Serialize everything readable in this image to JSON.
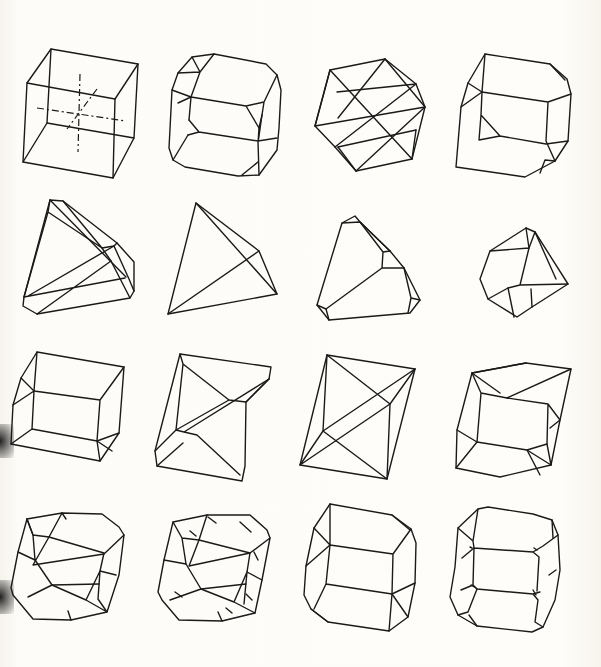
{
  "page": {
    "background": "#fdfcf8",
    "line_color": "#1a1a1a",
    "layout": "4x4 grid of crystal forms"
  },
  "figures": [
    {
      "row": 1,
      "col": 1,
      "name": "cube with crystallographic axes"
    },
    {
      "row": 1,
      "col": 2,
      "name": "cube modified by octahedron corners"
    },
    {
      "row": 1,
      "col": 3,
      "name": "cuboctahedron"
    },
    {
      "row": 1,
      "col": 4,
      "name": "cube with truncated corners"
    },
    {
      "row": 2,
      "col": 1,
      "name": "tetrahedron modified by cube"
    },
    {
      "row": 2,
      "col": 2,
      "name": "tetrahedron"
    },
    {
      "row": 2,
      "col": 3,
      "name": "tetrahedron with truncated corners"
    },
    {
      "row": 2,
      "col": 4,
      "name": "octahedron combination"
    },
    {
      "row": 3,
      "col": 1,
      "name": "cube with bevelled edges"
    },
    {
      "row": 3,
      "col": 2,
      "name": "rhombohedron with modified edges"
    },
    {
      "row": 3,
      "col": 3,
      "name": "rhombohedron"
    },
    {
      "row": 3,
      "col": 4,
      "name": "rhombohedron with truncations"
    },
    {
      "row": 4,
      "col": 1,
      "name": "complex combination form A"
    },
    {
      "row": 4,
      "col": 2,
      "name": "complex combination form B"
    },
    {
      "row": 4,
      "col": 3,
      "name": "prism with terminal faces"
    },
    {
      "row": 4,
      "col": 4,
      "name": "prism with rounded corner facets"
    }
  ]
}
